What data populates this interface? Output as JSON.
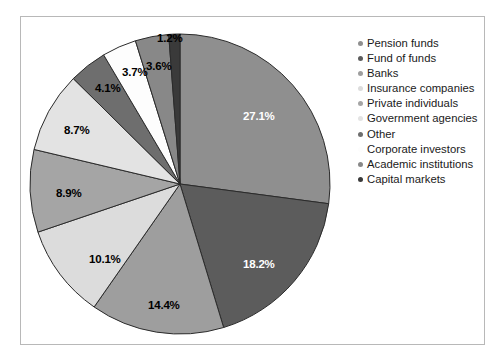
{
  "figure": {
    "border_color": "#b8b8b8",
    "background": "#ffffff"
  },
  "chart_data": {
    "type": "pie",
    "title": "",
    "subtitle": "",
    "xlabel": "",
    "ylabel": "",
    "legend_position": "right",
    "grid": false,
    "start_angle_deg": 0,
    "direction": "clockwise",
    "categories": [
      "Pension funds",
      "Fund of funds",
      "Banks",
      "Insurance companies",
      "Private individuals",
      "Government agencies",
      "Other",
      "Corporate investors",
      "Academic institutions",
      "Capital markets"
    ],
    "values": [
      27.1,
      18.2,
      14.4,
      10.1,
      8.9,
      8.7,
      4.1,
      3.7,
      3.6,
      1.2
    ],
    "value_labels": [
      "27.1%",
      "18.2%",
      "14.4%",
      "10.1%",
      "8.9%",
      "8.7%",
      "4.1%",
      "3.7%",
      "3.6%",
      "1.2%"
    ],
    "colors": [
      "#8f8f8f",
      "#5c5c5c",
      "#9e9e9e",
      "#dcdcdc",
      "#a5a5a5",
      "#e3e3e3",
      "#6e6e6e",
      "#fdfdfd",
      "#888888",
      "#3a3a3a"
    ],
    "slice_edge_color": "#2b2b2b",
    "label_colors": [
      "#ffffff",
      "#ffffff",
      "#000000",
      "#000000",
      "#000000",
      "#000000",
      "#000000",
      "#000000",
      "#000000",
      "#000000"
    ]
  },
  "pie": {
    "center_x": 180,
    "center_y": 184,
    "radius": 150,
    "labels": [
      {
        "text": "27.1%",
        "x": 243,
        "y": 110,
        "color": "#ffffff"
      },
      {
        "text": "18.2%",
        "x": 243,
        "y": 258,
        "color": "#ffffff"
      },
      {
        "text": "14.4%",
        "x": 148,
        "y": 299,
        "color": "#000000"
      },
      {
        "text": "10.1%",
        "x": 89,
        "y": 253,
        "color": "#000000"
      },
      {
        "text": "8.9%",
        "x": 56,
        "y": 187,
        "color": "#000000"
      },
      {
        "text": "8.7%",
        "x": 64,
        "y": 124,
        "color": "#000000"
      },
      {
        "text": "4.1%",
        "x": 95,
        "y": 82,
        "color": "#000000"
      },
      {
        "text": "3.7%",
        "x": 122,
        "y": 66,
        "color": "#000000"
      },
      {
        "text": "3.6%",
        "x": 146,
        "y": 60,
        "color": "#000000"
      },
      {
        "text": "1.2%",
        "x": 157,
        "y": 32,
        "color": "#000000"
      }
    ]
  },
  "legend": {
    "items": [
      {
        "label": "Pension funds",
        "color": "#8f8f8f"
      },
      {
        "label": "Fund of funds",
        "color": "#5c5c5c"
      },
      {
        "label": "Banks",
        "color": "#9e9e9e"
      },
      {
        "label": "Insurance companies",
        "color": "#dcdcdc"
      },
      {
        "label": "Private individuals",
        "color": "#a5a5a5"
      },
      {
        "label": "Government agencies",
        "color": "#e3e3e3"
      },
      {
        "label": "Other",
        "color": "#6e6e6e"
      },
      {
        "label": "Corporate investors",
        "color": "#fdfdfd"
      },
      {
        "label": "Academic institutions",
        "color": "#888888"
      },
      {
        "label": "Capital markets",
        "color": "#3a3a3a"
      }
    ]
  }
}
